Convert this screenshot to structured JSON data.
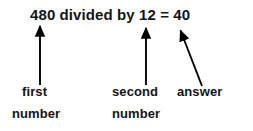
{
  "diagram": {
    "equation": {
      "full_text": "480 divided by 12 = 40",
      "dividend": "480",
      "operator_word": "divided by",
      "divisor": "12",
      "equals": "=",
      "quotient": "40"
    },
    "labels": [
      {
        "id": "first-number",
        "line1": "first",
        "line2": "number"
      },
      {
        "id": "second-number",
        "line1": "second",
        "line2": "number"
      },
      {
        "id": "answer",
        "line1": "answer",
        "line2": ""
      }
    ],
    "arrows": [
      {
        "id": "arrow-to-first-number",
        "kind": "vertical",
        "x1": 40,
        "y1": 85,
        "x2": 40,
        "y2": 22
      },
      {
        "id": "arrow-to-second-number",
        "kind": "vertical",
        "x1": 146,
        "y1": 85,
        "x2": 146,
        "y2": 24
      },
      {
        "id": "arrow-to-answer",
        "kind": "diagonal",
        "x1": 202,
        "y1": 86,
        "x2": 178,
        "y2": 26
      }
    ],
    "colors": {
      "background": "#ffffff",
      "ink": "#141414",
      "arrow": "#000000"
    }
  }
}
